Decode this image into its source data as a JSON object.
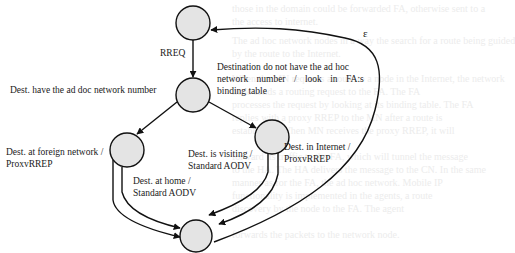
{
  "diagram": {
    "type": "state-transition",
    "nodes": [
      {
        "id": "start",
        "cx": 193,
        "cy": 23,
        "r": 17
      },
      {
        "id": "rreq-received",
        "cx": 193,
        "cy": 95,
        "r": 17
      },
      {
        "id": "foreign-network",
        "cx": 127,
        "cy": 150,
        "r": 17
      },
      {
        "id": "visiting-or-internet",
        "cx": 272,
        "cy": 137,
        "r": 17
      },
      {
        "id": "end",
        "cx": 196,
        "cy": 236,
        "r": 16
      }
    ],
    "colors": {
      "node_fill": "#e4e4e4",
      "stroke": "#111111",
      "text": "#1a1a1a",
      "ghost_text": "#ececec"
    },
    "labels": {
      "rreq": "RREQ",
      "dest_have_adhoc": "Dest. have the ad doc network number",
      "dest_not_have_line1": "Destination do not have the ad hoc",
      "dest_not_have_line2": "network number / look in FA:s",
      "dest_not_have_line3": "binding table",
      "foreign_line1": "Dest. at foreign network /",
      "foreign_line2": "ProxvRREP",
      "home_line1": "Dest. at home /",
      "home_line2": "Standard AODV",
      "visiting_line1": "Dest. is visiting /",
      "visiting_line2": "Standard AODV",
      "internet_line1": "Dest. in Internet /",
      "internet_line2": "ProxvRREP",
      "epsilon": "ε"
    },
    "edges": [
      {
        "from": "start",
        "to": "rreq-received",
        "label": "RREQ"
      },
      {
        "from": "rreq-received",
        "to": "foreign-network",
        "label": "Dest. have the ad doc network number"
      },
      {
        "from": "rreq-received",
        "to": "visiting-or-internet",
        "label": "Destination do not have the ad hoc network number / look in FA:s binding table"
      },
      {
        "from": "foreign-network",
        "to": "end",
        "label": "Dest. at foreign network / ProxvRREP"
      },
      {
        "from": "foreign-network",
        "to": "end",
        "label": "Dest. at home / Standard AODV"
      },
      {
        "from": "visiting-or-internet",
        "to": "end",
        "label": "Dest. is visiting / Standard AODV"
      },
      {
        "from": "visiting-or-internet",
        "to": "end",
        "label": "Dest. in Internet / ProxvRREP"
      },
      {
        "from": "end",
        "to": "start",
        "label": "ε"
      }
    ]
  },
  "background_ghost_text": [
    "those in the domain could be forwarded FA, otherwise sent to a",
    "the access to internet.",
    "The ad hoc network nodes in a way the search for a route being guided",
    "by the route to the Internet.",
    "When the MN requests a route to a node in the Internet, the network",
    "node sends a routing request to the FA. The FA",
    "processes the request by looking at its binding table. The FA",
    "replies with a proxy RREP to the MN after a route is",
    "established. When MN receives the proxy RREP, it will",
    "forward its traffic to the FA, which will tunnel the message",
    "to the HA. The HA delivers the message to the CN. In the same",
    "manner as for the FA, the ad hoc network. Mobile IP",
    "functionality is implemented in the agents, a route",
    "discovery by the node to the FA. The agent",
    "forwards the packets to the network node."
  ]
}
